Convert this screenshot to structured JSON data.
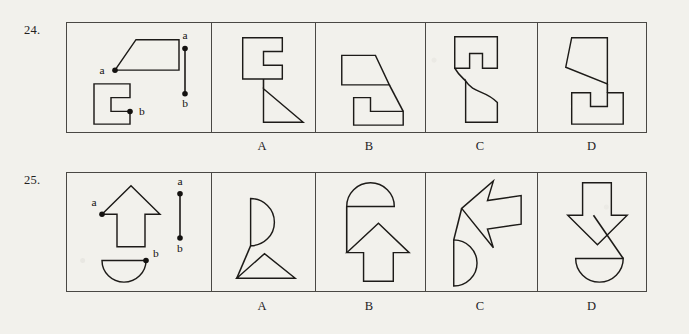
{
  "page": {
    "background_color": "#f2f1ec",
    "ink_color": "#1d1b18",
    "test_type": "spatial-assembly-multiple-choice"
  },
  "items": [
    {
      "number": "24.",
      "stimulus": {
        "name": "stimulus-panel",
        "point_a_label": "a",
        "point_b_label": "b",
        "connector_a_label": "a",
        "connector_b_label": "b",
        "shapes": [
          {
            "name": "trapezoid-with-point-a",
            "kind": "polygon",
            "marked_point": "a",
            "description": "right trapezoid, slanted left edge, point a at bottom-left vertex"
          },
          {
            "name": "c-bracket-with-point-b",
            "kind": "polygon",
            "marked_point": "b",
            "description": "C shaped bracket opening right, point b at inner lower notch corner"
          }
        ],
        "connector": {
          "name": "join-segment",
          "description": "vertical segment with endpoint a on top and endpoint b on bottom"
        }
      },
      "options": [
        {
          "label": "A",
          "name": "option-a",
          "correct_look": "c-bracket joined to right-pointing triangle"
        },
        {
          "label": "B",
          "name": "option-b",
          "correct_look": "trapezoid joined to L-shape by long diagonal"
        },
        {
          "label": "C",
          "name": "option-c",
          "correct_look": "notched block over curved-sided block"
        },
        {
          "label": "D",
          "name": "option-d",
          "correct_look": "slanted quad over notched block"
        }
      ]
    },
    {
      "number": "25.",
      "stimulus": {
        "name": "stimulus-panel",
        "point_a_label": "a",
        "point_b_label": "b",
        "connector_a_label": "a",
        "connector_b_label": "b",
        "shapes": [
          {
            "name": "up-arrow-with-point-a",
            "kind": "polygon",
            "marked_point": "a",
            "description": "upward pointing arrow, point a at left arrowhead tip"
          },
          {
            "name": "semicircle-with-point-b",
            "kind": "semicircle",
            "marked_point": "b",
            "description": "semicircle flat side up bulging down, point b at top-right end of the flat side"
          }
        ],
        "connector": {
          "name": "join-segment",
          "description": "vertical segment with endpoint a on top and endpoint b on bottom"
        }
      },
      "options": [
        {
          "label": "A",
          "name": "option-a",
          "correct_look": "right-bulging semicircle above a triangle"
        },
        {
          "label": "B",
          "name": "option-b",
          "correct_look": "dome above an up arrow"
        },
        {
          "label": "C",
          "name": "option-c",
          "correct_look": "tilted left arrow above a right-bulging semicircle"
        },
        {
          "label": "D",
          "name": "option-d",
          "correct_look": "down arrow overlapping a down-bulging semicircle"
        }
      ]
    }
  ]
}
